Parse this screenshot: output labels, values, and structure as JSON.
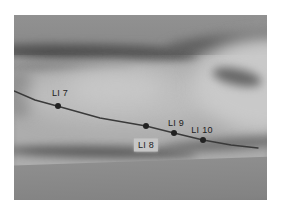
{
  "figure": {
    "type": "annotated-photo",
    "colors": {
      "meridian_line": "#3a3a3a",
      "point_dot": "#222222",
      "label_text": "#1c1c1c",
      "label_box": "#c6c6c6"
    },
    "line_points": [
      [
        0,
        76
      ],
      [
        21,
        85
      ],
      [
        43,
        91
      ],
      [
        86,
        103
      ],
      [
        132,
        111
      ],
      [
        160,
        118
      ],
      [
        189,
        125
      ],
      [
        217,
        130
      ],
      [
        244,
        133
      ]
    ],
    "points": [
      {
        "label": "LI 7",
        "x": 44,
        "y": 91,
        "label_cx": 46,
        "label_cy": 78,
        "boxed": false
      },
      {
        "label": "LI 8",
        "x": 132,
        "y": 111,
        "label_cx": 132,
        "label_cy": 130,
        "boxed": true
      },
      {
        "label": "LI 9",
        "x": 160,
        "y": 118,
        "label_cx": 162,
        "label_cy": 108,
        "boxed": false
      },
      {
        "label": "LI 10",
        "x": 189,
        "y": 125,
        "label_cx": 188,
        "label_cy": 115,
        "boxed": false
      }
    ]
  }
}
